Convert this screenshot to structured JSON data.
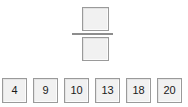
{
  "widget": {
    "name": "fraction-builder",
    "background_color": "#ffffff"
  },
  "fraction": {
    "numerator": {
      "label": "",
      "placeholder": "",
      "state": "empty"
    },
    "denominator": {
      "label": "",
      "placeholder": "",
      "state": "empty"
    },
    "bar": {
      "icon": "fraction-bar-icon"
    }
  },
  "tile_tray": {
    "tiles": [
      {
        "value": "4"
      },
      {
        "value": "9"
      },
      {
        "value": "10"
      },
      {
        "value": "13"
      },
      {
        "value": "18"
      },
      {
        "value": "20"
      }
    ]
  },
  "colors": {
    "tile_fill": "#f1f1f1",
    "tile_border": "#9a9a9a",
    "bar": "#8d8d8d",
    "text": "#1a1a1a",
    "background": "#ffffff"
  }
}
